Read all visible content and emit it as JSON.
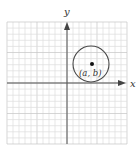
{
  "diagram": {
    "type": "coordinate-plane-circle",
    "axes": {
      "x_label": "x",
      "y_label": "y"
    },
    "point_label": "(a, b)",
    "colors": {
      "grid_minor": "#dcdcdc",
      "grid_major": "#c4c4c4",
      "axis": "#555555",
      "circle": "#4a4a4a",
      "point": "#111111"
    }
  }
}
